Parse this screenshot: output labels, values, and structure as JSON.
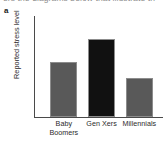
{
  "figure": {
    "panel_label": "a",
    "caption_sliver": "ers the diagrams below that illustrate th",
    "background_color": "#ffffff",
    "axis_color": "#4a4a4a"
  },
  "chart_data": {
    "type": "bar",
    "title": "",
    "xlabel": "",
    "ylabel": "Reported stress level",
    "categories": [
      "Baby Boomers",
      "Gen Xers",
      "Millennials"
    ],
    "category_lines": [
      [
        "Baby",
        "Boomers"
      ],
      [
        "Gen Xers"
      ],
      [
        "Millennials"
      ]
    ],
    "values": [
      66,
      93,
      46
    ],
    "ylim": [
      0,
      119
    ],
    "grid": false,
    "legend": false,
    "axis_ticks": false,
    "bar_colors": [
      "#595959",
      "#111111",
      "#595959"
    ],
    "bar_border_color": "#8c8c8c",
    "bar_width_pct": 21,
    "bar_centers_pct": [
      22.5,
      52.0,
      81.5
    ]
  }
}
